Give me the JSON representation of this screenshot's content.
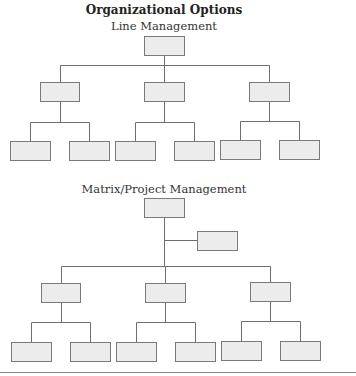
{
  "figure": {
    "title": "Organizational Options",
    "sections": [
      {
        "label": "Line Management",
        "root": {
          "x": 144,
          "y": 36,
          "w": 40,
          "h": 19
        },
        "bus_y": 65,
        "managers": [
          {
            "x": 40,
            "y": 82,
            "w": 39,
            "h": 19,
            "leaves": [
              {
                "x": 10,
                "y": 141
              },
              {
                "x": 69,
                "y": 141
              }
            ],
            "sub_y": 122
          },
          {
            "x": 144,
            "y": 82,
            "w": 40,
            "h": 19,
            "leaves": [
              {
                "x": 115,
                "y": 141
              },
              {
                "x": 174,
                "y": 141
              }
            ],
            "sub_y": 122
          },
          {
            "x": 249,
            "y": 82,
            "w": 40,
            "h": 19,
            "leaves": [
              {
                "x": 220,
                "y": 140
              },
              {
                "x": 279,
                "y": 140
              }
            ],
            "sub_y": 121
          }
        ]
      },
      {
        "label": "Matrix/Project Management",
        "root": {
          "x": 144,
          "y": 198,
          "w": 40,
          "h": 19
        },
        "staff": {
          "x": 197,
          "y": 231,
          "w": 40,
          "h": 19,
          "branch_y": 240
        },
        "bus_y": 266,
        "managers": [
          {
            "x": 41,
            "y": 283,
            "w": 39,
            "h": 19,
            "leaves": [
              {
                "x": 11,
                "y": 342
              },
              {
                "x": 70,
                "y": 342
              }
            ],
            "sub_y": 322
          },
          {
            "x": 145,
            "y": 283,
            "w": 40,
            "h": 19,
            "leaves": [
              {
                "x": 116,
                "y": 342
              },
              {
                "x": 175,
                "y": 342
              }
            ],
            "sub_y": 322
          },
          {
            "x": 250,
            "y": 282,
            "w": 40,
            "h": 19,
            "leaves": [
              {
                "x": 221,
                "y": 341
              },
              {
                "x": 280,
                "y": 341
              }
            ],
            "sub_y": 321
          }
        ]
      }
    ],
    "colors": {
      "box_fill": "#ececec",
      "box_stroke": "#7a7a7a",
      "line": "#6e6e6e"
    }
  }
}
